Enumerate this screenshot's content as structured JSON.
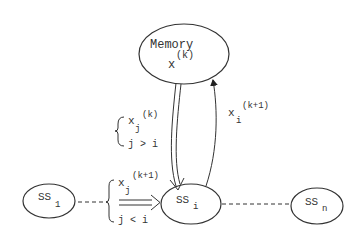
{
  "nodes": {
    "memory": {
      "label": "Memory",
      "var": "x",
      "sup": "(k)"
    },
    "ss1": {
      "label": "SS",
      "sub": "1"
    },
    "ssi": {
      "label": "SS",
      "sub": "i"
    },
    "ssn": {
      "label": "SS",
      "sub": "n"
    }
  },
  "edges": {
    "memory_to_ssi": {
      "var": "x",
      "sub": "j",
      "sup": "(k)",
      "condition": "j > i"
    },
    "ssi_to_memory": {
      "var": "x",
      "sub": "i",
      "sup": "(k+1)"
    },
    "ss1_to_ssi": {
      "var": "x",
      "sub": "j",
      "sup": "(k+1)",
      "condition": "j < i"
    }
  },
  "colors": {
    "stroke": "#333333",
    "background": "#ffffff"
  }
}
